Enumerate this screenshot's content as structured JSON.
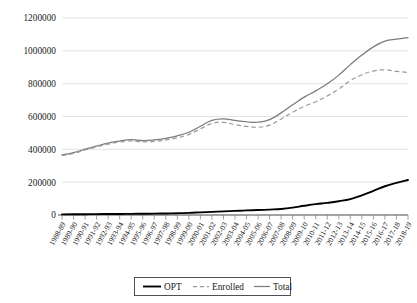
{
  "chart_data": {
    "type": "line",
    "title": "",
    "xlabel": "",
    "ylabel": "",
    "ylim": [
      0,
      1200000
    ],
    "ytick_values": [
      0,
      200000,
      400000,
      600000,
      800000,
      1000000,
      1200000
    ],
    "ytick_labels": [
      "0",
      "200000",
      "400000",
      "600000",
      "800000",
      "1000000",
      "1200000"
    ],
    "grid": true,
    "legend_position": "bottom",
    "categories": [
      "1988-89",
      "1989-90",
      "1990-91",
      "1991-92",
      "1992-93",
      "1993-94",
      "1994-95",
      "1995-96",
      "1996-97",
      "1997-98",
      "1998-99",
      "1999-00",
      "2000-01",
      "2001-02",
      "2002-03",
      "2003-04",
      "2004-05",
      "2005-06",
      "2006-07",
      "2007-08",
      "2008-09",
      "2009-10",
      "2010-11",
      "2011-12",
      "2012-13",
      "2013-14",
      "2014-15",
      "2015-16",
      "2016-17",
      "2017-18",
      "2018-19"
    ],
    "series": [
      {
        "name": "OPT",
        "style": "solid-black",
        "color": "#000000",
        "values": [
          4000,
          4500,
          5000,
          5500,
          6000,
          6500,
          7000,
          7500,
          8500,
          9500,
          11000,
          13000,
          16000,
          19000,
          22000,
          25000,
          28000,
          30000,
          33000,
          37000,
          45000,
          56000,
          66000,
          74000,
          84000,
          97000,
          120000,
          147000,
          175000,
          196000,
          213000
        ]
      },
      {
        "name": "Enrolled",
        "style": "dashed-gray",
        "color": "#9a9a9a",
        "values": [
          362000,
          375000,
          396000,
          415000,
          432000,
          444000,
          452000,
          445000,
          448000,
          457000,
          471000,
          491000,
          525000,
          558000,
          564000,
          551000,
          540000,
          535000,
          548000,
          585000,
          626000,
          662000,
          690000,
          725000,
          768000,
          819000,
          854000,
          877000,
          884000,
          875000,
          868000
        ]
      },
      {
        "name": "Total",
        "style": "solid-gray",
        "color": "#7b7b7b",
        "values": [
          366000,
          380000,
          401000,
          420000,
          438000,
          450000,
          459000,
          453000,
          457000,
          467000,
          482000,
          504000,
          541000,
          577000,
          586000,
          576000,
          568000,
          565000,
          581000,
          622000,
          671000,
          718000,
          756000,
          799000,
          852000,
          916000,
          974000,
          1024000,
          1059000,
          1071000,
          1081000
        ]
      }
    ]
  },
  "legend": {
    "items": [
      {
        "label": "OPT",
        "style": "solid-black"
      },
      {
        "label": "Enrolled",
        "style": "dashed-gray"
      },
      {
        "label": "Total",
        "style": "solid-gray"
      }
    ]
  }
}
